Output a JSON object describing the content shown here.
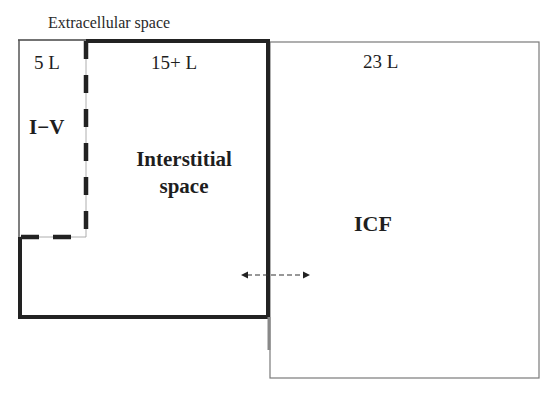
{
  "diagram": {
    "title": "Extracellular space",
    "compartments": [
      {
        "id": "intravascular",
        "label": "I−V",
        "volume": "5 L"
      },
      {
        "id": "interstitial",
        "label_line1": "Interstitial",
        "label_line2": "space",
        "volume": "15+ L"
      },
      {
        "id": "icf",
        "label": "ICF",
        "volume": "23 L"
      }
    ],
    "connector": {
      "type": "double-headed-dashed-arrow",
      "between": [
        "Interstitial space",
        "ICF"
      ]
    },
    "colors": {
      "thick_border": "#222222",
      "thin_border": "#777777",
      "text": "#1e1e1e",
      "background": "#ffffff"
    }
  }
}
